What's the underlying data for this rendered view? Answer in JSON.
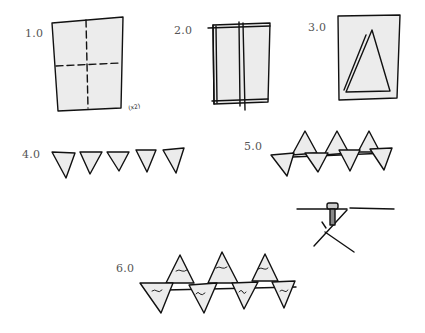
{
  "figure": {
    "fill_color": "#ececec",
    "stroke_color": "#111111",
    "label_color": "#555555"
  },
  "steps": [
    {
      "label": "1.0",
      "description": "rectangular sheet with dashed center fold lines",
      "annotation": "(x2)"
    },
    {
      "label": "2.0",
      "description": "sheet folded into vertical strips"
    },
    {
      "label": "3.0",
      "description": "triangle drawn inside rectangle"
    },
    {
      "label": "4.0",
      "description": "five inverted triangles in a row"
    },
    {
      "label": "5.0",
      "description": "interlocking alternating triangles; detail of pin through strip"
    },
    {
      "label": "6.0",
      "description": "interlocking triangles with handwritten marks"
    }
  ]
}
